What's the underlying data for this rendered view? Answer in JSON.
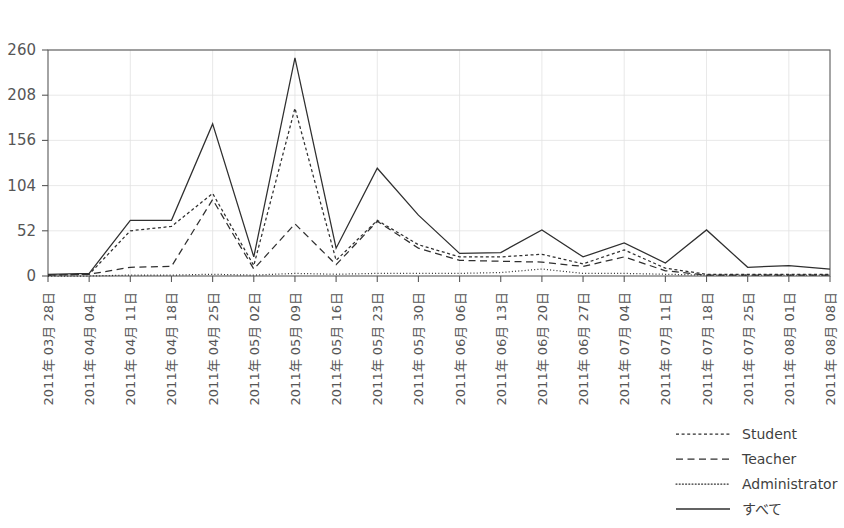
{
  "chart_data": {
    "type": "line",
    "title": "",
    "xlabel": "",
    "ylabel": "",
    "ylim": [
      0,
      260
    ],
    "yticks": [
      0,
      52,
      104,
      156,
      208,
      260
    ],
    "grid": true,
    "legend_position": "bottom-right",
    "categories": [
      "2011年 03月 28日",
      "2011年 04月 04日",
      "2011年 04月 11日",
      "2011年 04月 18日",
      "2011年 04月 25日",
      "2011年 05月 02日",
      "2011年 05月 09日",
      "2011年 05月 16日",
      "2011年 05月 23日",
      "2011年 05月 30日",
      "2011年 06月 06日",
      "2011年 06月 13日",
      "2011年 06月 20日",
      "2011年 06月 27日",
      "2011年 07月 04日",
      "2011年 07月 11日",
      "2011年 07月 18日",
      "2011年 07月 25日",
      "2011年 08月 01日",
      "2011年 08月 08日"
    ],
    "series": [
      {
        "name": "Student",
        "style": "dashed-fine",
        "values": [
          1,
          2,
          52,
          57,
          95,
          12,
          193,
          18,
          64,
          36,
          22,
          22,
          25,
          14,
          30,
          9,
          2,
          2,
          2,
          2
        ]
      },
      {
        "name": "Teacher",
        "style": "dashed-long",
        "values": [
          1,
          2,
          10,
          11,
          88,
          8,
          60,
          13,
          63,
          32,
          18,
          17,
          16,
          11,
          22,
          6,
          1,
          1,
          1,
          1
        ]
      },
      {
        "name": "Administrator",
        "style": "dotted",
        "values": [
          0,
          0,
          1,
          1,
          2,
          1,
          3,
          2,
          3,
          3,
          3,
          4,
          8,
          3,
          3,
          2,
          1,
          1,
          1,
          1
        ]
      },
      {
        "name": "すべて",
        "style": "solid",
        "values": [
          2,
          3,
          64,
          64,
          175,
          22,
          251,
          32,
          124,
          70,
          26,
          27,
          53,
          22,
          38,
          15,
          53,
          10,
          12,
          8
        ]
      }
    ]
  },
  "legend": {
    "items": [
      {
        "label": "Student",
        "style": "dashed-fine"
      },
      {
        "label": "Teacher",
        "style": "dashed-long"
      },
      {
        "label": "Administrator",
        "style": "dotted"
      },
      {
        "label": "すべて",
        "style": "solid"
      }
    ]
  },
  "colors": {
    "line": "#2f2f2f",
    "axis": "#595959",
    "grid": "#e2e2e2",
    "text": "#565656",
    "background": "#ffffff"
  }
}
